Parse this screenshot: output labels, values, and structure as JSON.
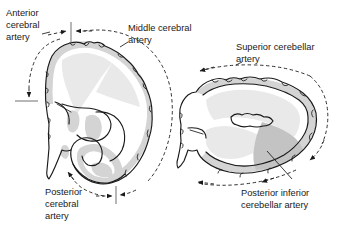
{
  "figure": {
    "background_color": "#ffffff",
    "ink_color": "#1a1a1a"
  },
  "labels": {
    "anterior_cerebral_artery": {
      "name": "Anterior cerebral artery",
      "lines": [
        "Anterior",
        "cerebral",
        "artery"
      ],
      "line1": "Anterior",
      "line2": "cerebral",
      "line3": "artery"
    },
    "middle_cerebral_artery": {
      "name": "Middle cerebral artery",
      "lines": [
        "Middle cerebral",
        "artery"
      ],
      "line1": "Middle cerebral",
      "line2": "artery"
    },
    "posterior_cerebral_artery": {
      "name": "Posterior cerebral artery",
      "lines": [
        "Posterior",
        "cerebral",
        "artery"
      ],
      "line1": "Posterior",
      "line2": "cerebral",
      "line3": "artery"
    },
    "superior_cerebellar_artery": {
      "name": "Superior cerebellar artery",
      "lines": [
        "Superior cerebellar",
        "artery"
      ],
      "line1": "Superior cerebellar",
      "line2": "artery"
    },
    "posterior_inferior_cerebellar_artery": {
      "name": "Posterior inferior cerebellar artery",
      "lines": [
        "Posterior inferior",
        "cerebellar artery"
      ],
      "line1": "Posterior inferior",
      "line2": "cerebellar artery"
    }
  },
  "sections": {
    "left": {
      "name": "Cerebral hemisphere section",
      "territories": [
        "anterior cerebral artery",
        "middle cerebral artery",
        "posterior cerebral artery"
      ]
    },
    "right": {
      "name": "Cerebellum and brainstem section",
      "territories": [
        "superior cerebellar artery",
        "posterior inferior cerebellar artery"
      ]
    }
  },
  "colors": {
    "cortical_ribbon_gray": "#d4d4d4",
    "light_territory_gray": "#e9e9e9",
    "dark_territory_gray": "#c3c3c3",
    "outline": "#1a1a1a",
    "background": "#ffffff"
  }
}
